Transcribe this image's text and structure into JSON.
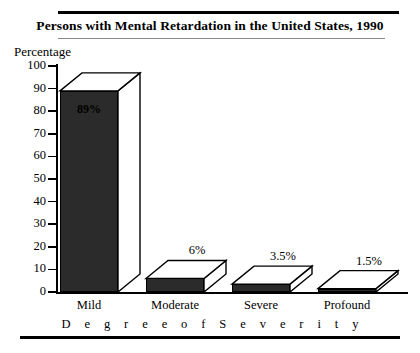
{
  "chart_data": {
    "type": "bar",
    "title": "Persons with Mental Retardation in the United States, 1990",
    "xlabel": "D e g r e e   o f   S e v e r i t y",
    "ylabel": "Percentage",
    "categories": [
      "Mild",
      "Moderate",
      "Severe",
      "Profound"
    ],
    "values": [
      89,
      6,
      3.5,
      1.5
    ],
    "value_labels": [
      "89%",
      "6%",
      "3.5%",
      "1.5%"
    ],
    "ylim": [
      0,
      100
    ],
    "yticks": [
      0,
      10,
      20,
      30,
      40,
      50,
      60,
      70,
      80,
      90,
      100
    ],
    "ytick_labels": [
      "0",
      "10",
      "20",
      "30",
      "40",
      "50",
      "60",
      "70",
      "80",
      "90",
      "100"
    ],
    "grid": false,
    "legend": "none",
    "style": "3d-bar",
    "bar_face_color": "#2b2b2b",
    "bar_top_color": "#ffffff",
    "bar_side_color": "#ffffff",
    "bar_outline_color": "#000000",
    "background_color": "#ffffff",
    "axis_color": "#000000"
  },
  "decor": {
    "rule_top_color": "#000000",
    "rule_under_title_color": "#8a8a8a",
    "rule_bottom_color": "#000000"
  }
}
